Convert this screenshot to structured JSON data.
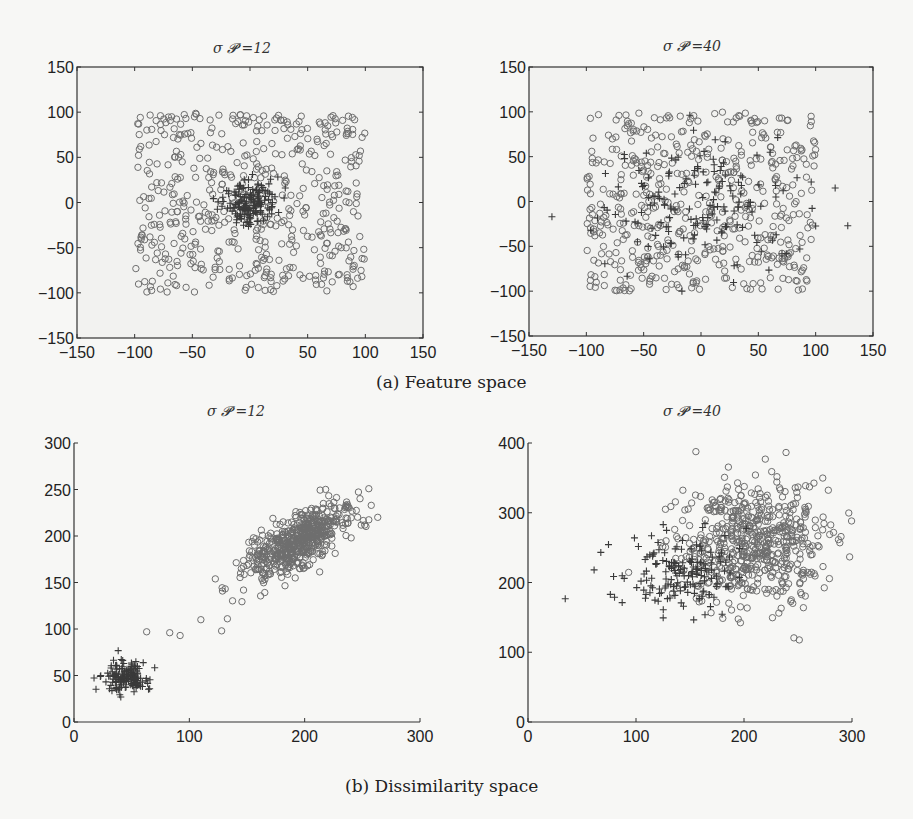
{
  "figure": {
    "captions": {
      "a": "(a) Feature space",
      "b": "(b) Dissimilarity space"
    }
  },
  "chart_data": [
    {
      "id": "a-left",
      "type": "scatter",
      "title": "σ 𝓟 =12",
      "group": "(a) Feature space",
      "xlim": [
        -150,
        150
      ],
      "ylim": [
        -150,
        150
      ],
      "xticks": [
        -150,
        -100,
        -50,
        0,
        50,
        100,
        150
      ],
      "yticks": [
        -150,
        -100,
        -50,
        0,
        50,
        100,
        150
      ],
      "box": true,
      "grid": false,
      "series": [
        {
          "name": "class circle",
          "marker": "o",
          "distribution": "uniform",
          "x_range": [
            -100,
            100
          ],
          "y_range": [
            -100,
            100
          ],
          "n": 520
        },
        {
          "name": "class plus",
          "marker": "+",
          "distribution": "gaussian",
          "center": [
            0,
            0
          ],
          "std": [
            12,
            12
          ],
          "n": 160
        }
      ]
    },
    {
      "id": "a-right",
      "type": "scatter",
      "title": "σ 𝓟 =40",
      "group": "(a) Feature space",
      "xlim": [
        -150,
        150
      ],
      "ylim": [
        -150,
        150
      ],
      "xticks": [
        -150,
        -100,
        -50,
        0,
        50,
        100,
        150
      ],
      "yticks": [
        -150,
        -100,
        -50,
        0,
        50,
        100,
        150
      ],
      "box": true,
      "grid": false,
      "series": [
        {
          "name": "class circle",
          "marker": "o",
          "distribution": "uniform",
          "x_range": [
            -100,
            100
          ],
          "y_range": [
            -100,
            100
          ],
          "n": 520
        },
        {
          "name": "class plus",
          "marker": "+",
          "distribution": "gaussian",
          "center": [
            0,
            0
          ],
          "std": [
            40,
            40
          ],
          "n": 160
        }
      ],
      "annotations": [
        {
          "note": "outlier plus markers",
          "points": [
            [
              -130,
              -17
            ],
            [
              117,
              15
            ],
            [
              128,
              -27
            ]
          ]
        }
      ]
    },
    {
      "id": "b-left",
      "type": "scatter",
      "title": "σ 𝓟 =12",
      "group": "(b) Dissimilarity space",
      "xlim": [
        0,
        300
      ],
      "ylim": [
        0,
        300
      ],
      "xticks": [
        0,
        100,
        200,
        300
      ],
      "yticks": [
        0,
        50,
        100,
        150,
        200,
        250,
        300
      ],
      "box": false,
      "grid": false,
      "series": [
        {
          "name": "class circle",
          "marker": "o",
          "distribution": "correlated-gaussian",
          "center": [
            195,
            195
          ],
          "std_major": 30,
          "std_minor": 12,
          "angle_deg": 40,
          "n": 560,
          "extra_points": [
            [
              63,
              97
            ],
            [
              83,
              96
            ],
            [
              92,
              93
            ],
            [
              110,
              110
            ],
            [
              133,
              111
            ],
            [
              128,
              98
            ]
          ]
        },
        {
          "name": "class plus",
          "marker": "+",
          "distribution": "gaussian",
          "center": [
            45,
            47
          ],
          "std": [
            9,
            9
          ],
          "n": 150
        }
      ]
    },
    {
      "id": "b-right",
      "type": "scatter",
      "title": "σ 𝓟 =40",
      "group": "(b) Dissimilarity space",
      "xlim": [
        0,
        300
      ],
      "ylim": [
        0,
        400
      ],
      "xticks": [
        0,
        100,
        200,
        300
      ],
      "yticks": [
        0,
        100,
        200,
        300,
        400
      ],
      "box": false,
      "grid": false,
      "series": [
        {
          "name": "class circle",
          "marker": "o",
          "distribution": "gaussian",
          "center": [
            210,
            255
          ],
          "std": [
            35,
            45
          ],
          "n": 600
        },
        {
          "name": "class plus",
          "marker": "+",
          "distribution": "gaussian",
          "center": [
            140,
            215
          ],
          "std": [
            30,
            28
          ],
          "n": 160
        }
      ]
    }
  ]
}
